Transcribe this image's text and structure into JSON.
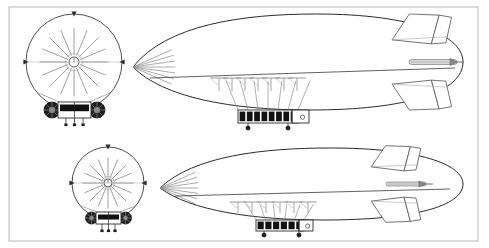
{
  "sheet": {
    "title": "Airship general arrangement drawing",
    "background_color": "#ffffff",
    "width": 489,
    "height": 248,
    "border": {
      "name": "drawing-border-frame",
      "color": "#b9b9b9",
      "stroke_width": 1,
      "x": 9,
      "y": 7,
      "width": 469,
      "height": 234
    }
  },
  "style": {
    "line_color": "#3a3a3a",
    "envelope_color": "#2b2b2b",
    "light_line_color": "#a8a8a8",
    "rig_line_color": "#8f8f8f",
    "window_fill": "#111111",
    "hull_fill": "#ffffff",
    "fin_color": "#5a5a5a",
    "shaft_fill": "#d8d8d8",
    "gondola_stroke": "#2b2b2b"
  },
  "figures": [
    {
      "id": "airship-upper",
      "label": "Upper airship - large scale",
      "scale": 1.0,
      "front_view": {
        "name": "front-elevation-view-upper",
        "envelope_circle": {
          "cx": 74,
          "cy": 62,
          "r": 48
        },
        "hub_circle": {
          "cx": 74,
          "cy": 62,
          "r": 5
        },
        "radial_spokes": 16,
        "spoke_inner_radius": 7,
        "spoke_outer_radius": 34,
        "cardinal_ticks": [
          {
            "angle": 270,
            "label": "top-marker"
          },
          {
            "angle": 0,
            "label": "right-marker"
          },
          {
            "angle": 180,
            "label": "left-marker"
          }
        ],
        "gondola": {
          "name": "front-view-gondola-upper",
          "x": 58,
          "y": 102,
          "width": 33,
          "height": 16,
          "engine_pods": 2,
          "pod_radius": 8,
          "pod_offset_x": 21,
          "pod_cy": 110,
          "suspension_lines": 4,
          "landing_struts": 3
        }
      },
      "side_view": {
        "name": "side-elevation-view-upper",
        "envelope_ellipse": {
          "cx": 300,
          "cy": 62,
          "rx": 163,
          "ry": 48
        },
        "nose_point": {
          "x": 133,
          "y": 67
        },
        "nose_rigging_lines": 7,
        "keel_line": {
          "x1": 150,
          "y1": 78,
          "x2": 455,
          "y2": 68
        },
        "masts": {
          "name": "mast-array-upper",
          "count": 7,
          "start_x": 219,
          "spacing": 13,
          "top_y": 78,
          "cap_width": 17,
          "stem_height": 13
        },
        "gondola": {
          "name": "side-view-gondola-upper",
          "x": 238,
          "y": 110,
          "width": 60,
          "height": 13,
          "windows": 8,
          "window_fill": "#111111",
          "rear_cabin": {
            "x": 292,
            "y": 110,
            "width": 17,
            "height": 13
          },
          "landing_wheels": 2,
          "wheel_positions": [
            248,
            288
          ],
          "wheel_y": 128,
          "suspension_cables": 7
        },
        "propeller_shaft": {
          "name": "propeller-drive-shaft-upper",
          "x": 409,
          "y": 62,
          "length": 48,
          "thickness": 5
        },
        "tail_fins": {
          "name": "tail-fin-assembly-upper",
          "upper_fin": {
            "x": 417,
            "y": 13,
            "span": 48
          },
          "lower_fin": {
            "x": 417,
            "y": 88,
            "span": 48
          },
          "rudder_panels": 2
        }
      }
    },
    {
      "id": "airship-lower",
      "label": "Lower airship - small scale",
      "scale": 0.72,
      "front_view": {
        "name": "front-elevation-view-lower",
        "envelope_circle": {
          "cx": 108,
          "cy": 183,
          "r": 36
        },
        "hub_circle": {
          "cx": 108,
          "cy": 183,
          "r": 4
        },
        "radial_spokes": 16,
        "spoke_inner_radius": 5,
        "spoke_outer_radius": 25,
        "cardinal_ticks": [
          {
            "angle": 270,
            "label": "top-marker"
          },
          {
            "angle": 0,
            "label": "right-marker"
          },
          {
            "angle": 180,
            "label": "left-marker"
          }
        ],
        "gondola": {
          "name": "front-view-gondola-lower",
          "x": 96,
          "y": 212,
          "width": 25,
          "height": 12,
          "engine_pods": 2,
          "pod_radius": 6,
          "pod_offset_x": 16,
          "pod_cy": 218,
          "suspension_lines": 4,
          "landing_struts": 3
        }
      },
      "side_view": {
        "name": "side-elevation-view-lower",
        "envelope_ellipse": {
          "cx": 315,
          "cy": 184,
          "rx": 148,
          "ry": 36
        },
        "nose_point": {
          "x": 160,
          "y": 188
        },
        "nose_rigging_lines": 7,
        "keel_line": {
          "x1": 175,
          "y1": 196,
          "x2": 450,
          "y2": 189
        },
        "masts": {
          "name": "mast-array-lower",
          "count": 6,
          "start_x": 238,
          "spacing": 14,
          "top_y": 202,
          "cap_width": 16,
          "stem_height": 11
        },
        "gondola": {
          "name": "side-view-gondola-lower",
          "x": 256,
          "y": 220,
          "width": 48,
          "height": 11,
          "windows": 6,
          "window_fill": "#111111",
          "rear_cabin": {
            "x": 299,
            "y": 220,
            "width": 14,
            "height": 11
          },
          "landing_wheels": 2,
          "wheel_positions": [
            264,
            299
          ],
          "wheel_y": 235,
          "suspension_cables": 6
        },
        "propeller_shaft": {
          "name": "propeller-drive-shaft-lower",
          "x": 386,
          "y": 184,
          "length": 40,
          "thickness": 4
        },
        "tail_fins": {
          "name": "tail-fin-assembly-lower",
          "upper_fin": {
            "x": 392,
            "y": 147,
            "span": 40
          },
          "lower_fin": {
            "x": 392,
            "y": 205,
            "span": 40
          },
          "rudder_panels": 2
        }
      }
    }
  ]
}
